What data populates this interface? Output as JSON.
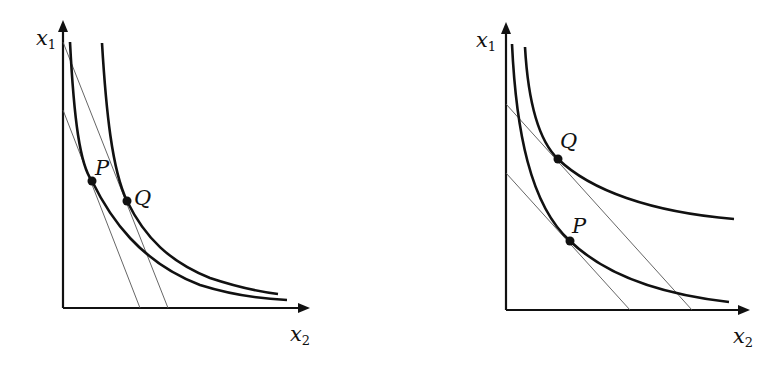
{
  "figure": {
    "panels": [
      {
        "id": "left",
        "axes": {
          "y_label": "x",
          "y_sub": "1",
          "x_label": "x",
          "x_sub": "2"
        },
        "points": [
          {
            "label": "P"
          },
          {
            "label": "Q"
          }
        ],
        "description": "Two indifference curves; steeper budget lines; P on lower curve, Q on upper curve, shifted right"
      },
      {
        "id": "right",
        "axes": {
          "y_label": "x",
          "y_sub": "1",
          "x_label": "x",
          "x_sub": "2"
        },
        "points": [
          {
            "label": "Q"
          },
          {
            "label": "P"
          }
        ],
        "description": "Two indifference curves; parallel budget lines; Q on upper curve, P on lower curve"
      }
    ],
    "colors": {
      "curve": "#111111",
      "budget_line": "#555555",
      "axis": "#111111",
      "background": "#ffffff"
    }
  }
}
